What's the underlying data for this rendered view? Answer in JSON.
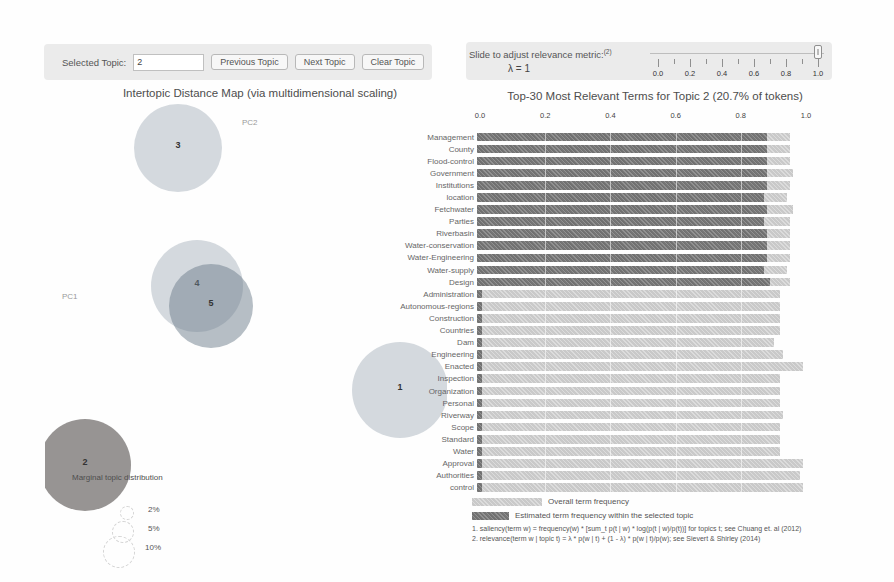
{
  "window": {
    "width": 894,
    "height": 582
  },
  "controls": {
    "selected_topic": {
      "label": "Selected Topic:",
      "value": "2"
    },
    "buttons": [
      {
        "label": "Previous Topic"
      },
      {
        "label": "Next Topic"
      },
      {
        "label": "Clear Topic"
      }
    ],
    "relevance_slider": {
      "label": "Slide to adjust relevance metric:",
      "footnote_ref": "(2)",
      "lambda_readout": "λ = 1",
      "value": 1.0,
      "min": 0.0,
      "max": 1.0,
      "tick_labels": [
        "0.0",
        "0.2",
        "0.4",
        "0.6",
        "0.8",
        "1.0"
      ]
    }
  },
  "legend": {
    "overall": "Overall term frequency",
    "topic": "Estimated term frequency within the selected topic"
  },
  "footnotes": [
    "1. saliency(term w) = frequency(w) * [sum_t p(t | w) * log(p(t | w)/p(t))] for topics t; see Chuang et. al (2012)",
    "2. relevance(term w | topic t) = λ * p(w | t) + (1 - λ) * p(w | t)/p(w); see Sievert & Shirley (2014)"
  ],
  "colors": {
    "panel_bg": "#ebebeb",
    "overall_bar": "#c9c9c9",
    "topic_bar": "#767676",
    "circle_fill": "rgba(125,140,155,0.32)",
    "circle_dark_fill": "rgba(110,125,140,0.50)",
    "selected_circle_fill": "rgba(128,125,123,0.82)"
  },
  "chart_data": [
    {
      "type": "scatter",
      "title": "Intertopic Distance Map (via multidimensional scaling)",
      "x_axis_label": "PC1",
      "y_axis_label": "PC2",
      "size_legend_title": "Marginal topic distribution",
      "size_legend_items": [
        "2%",
        "5%",
        "10%"
      ],
      "selected_topic": 2,
      "topics": [
        {
          "id": 3,
          "cx": 178,
          "cy": 148,
          "r": 44,
          "selected": false,
          "shade": "light"
        },
        {
          "id": 4,
          "cx": 197,
          "cy": 286,
          "r": 46,
          "selected": false,
          "shade": "light"
        },
        {
          "id": 5,
          "cx": 211,
          "cy": 306,
          "r": 42,
          "selected": false,
          "shade": "dark"
        },
        {
          "id": 1,
          "cx": 400,
          "cy": 390,
          "r": 48,
          "selected": false,
          "shade": "light"
        },
        {
          "id": 2,
          "cx": 85,
          "cy": 465,
          "r": 46,
          "selected": true,
          "shade": "selected"
        }
      ]
    },
    {
      "type": "bar",
      "title": "Top-30 Most Relevant Terms for Topic 2 (20.7% of tokens)",
      "xlim": [
        0.0,
        1.0
      ],
      "x_ticks": [
        "0.0",
        "0.2",
        "0.4",
        "0.6",
        "0.8",
        "1.0"
      ],
      "series": [
        {
          "name": "Estimated term frequency within the selected topic"
        },
        {
          "name": "Overall term frequency"
        }
      ],
      "terms": [
        {
          "term": "Management",
          "topic_freq": 0.89,
          "overall_freq": 0.96
        },
        {
          "term": "County",
          "topic_freq": 0.89,
          "overall_freq": 0.96
        },
        {
          "term": "Flood-control",
          "topic_freq": 0.89,
          "overall_freq": 0.96
        },
        {
          "term": "Government",
          "topic_freq": 0.89,
          "overall_freq": 0.97
        },
        {
          "term": "Institutions",
          "topic_freq": 0.89,
          "overall_freq": 0.96
        },
        {
          "term": "location",
          "topic_freq": 0.88,
          "overall_freq": 0.95
        },
        {
          "term": "Fetchwater",
          "topic_freq": 0.89,
          "overall_freq": 0.97
        },
        {
          "term": "Parties",
          "topic_freq": 0.88,
          "overall_freq": 0.96
        },
        {
          "term": "Riverbasin",
          "topic_freq": 0.89,
          "overall_freq": 0.96
        },
        {
          "term": "Water-conservation",
          "topic_freq": 0.89,
          "overall_freq": 0.96
        },
        {
          "term": "Water-Engineering",
          "topic_freq": 0.89,
          "overall_freq": 0.96
        },
        {
          "term": "Water-supply",
          "topic_freq": 0.88,
          "overall_freq": 0.95
        },
        {
          "term": "Design",
          "topic_freq": 0.9,
          "overall_freq": 0.96
        },
        {
          "term": "Administration",
          "topic_freq": 0.015,
          "overall_freq": 0.93
        },
        {
          "term": "Autonomous-regions",
          "topic_freq": 0.015,
          "overall_freq": 0.93
        },
        {
          "term": "Construction",
          "topic_freq": 0.015,
          "overall_freq": 0.93
        },
        {
          "term": "Countries",
          "topic_freq": 0.015,
          "overall_freq": 0.93
        },
        {
          "term": "Dam",
          "topic_freq": 0.015,
          "overall_freq": 0.91
        },
        {
          "term": "Engineering",
          "topic_freq": 0.015,
          "overall_freq": 0.94
        },
        {
          "term": "Enacted",
          "topic_freq": 0.015,
          "overall_freq": 1.0
        },
        {
          "term": "Inspection",
          "topic_freq": 0.015,
          "overall_freq": 0.93
        },
        {
          "term": "Organization",
          "topic_freq": 0.015,
          "overall_freq": 0.93
        },
        {
          "term": "Personal",
          "topic_freq": 0.015,
          "overall_freq": 0.93
        },
        {
          "term": "Riverway",
          "topic_freq": 0.015,
          "overall_freq": 0.94
        },
        {
          "term": "Scope",
          "topic_freq": 0.015,
          "overall_freq": 0.93
        },
        {
          "term": "Standard",
          "topic_freq": 0.015,
          "overall_freq": 0.93
        },
        {
          "term": "Water",
          "topic_freq": 0.015,
          "overall_freq": 0.93
        },
        {
          "term": "Approval",
          "topic_freq": 0.015,
          "overall_freq": 1.0
        },
        {
          "term": "Authorities",
          "topic_freq": 0.015,
          "overall_freq": 0.99
        },
        {
          "term": "control",
          "topic_freq": 0.015,
          "overall_freq": 1.0
        }
      ]
    }
  ]
}
